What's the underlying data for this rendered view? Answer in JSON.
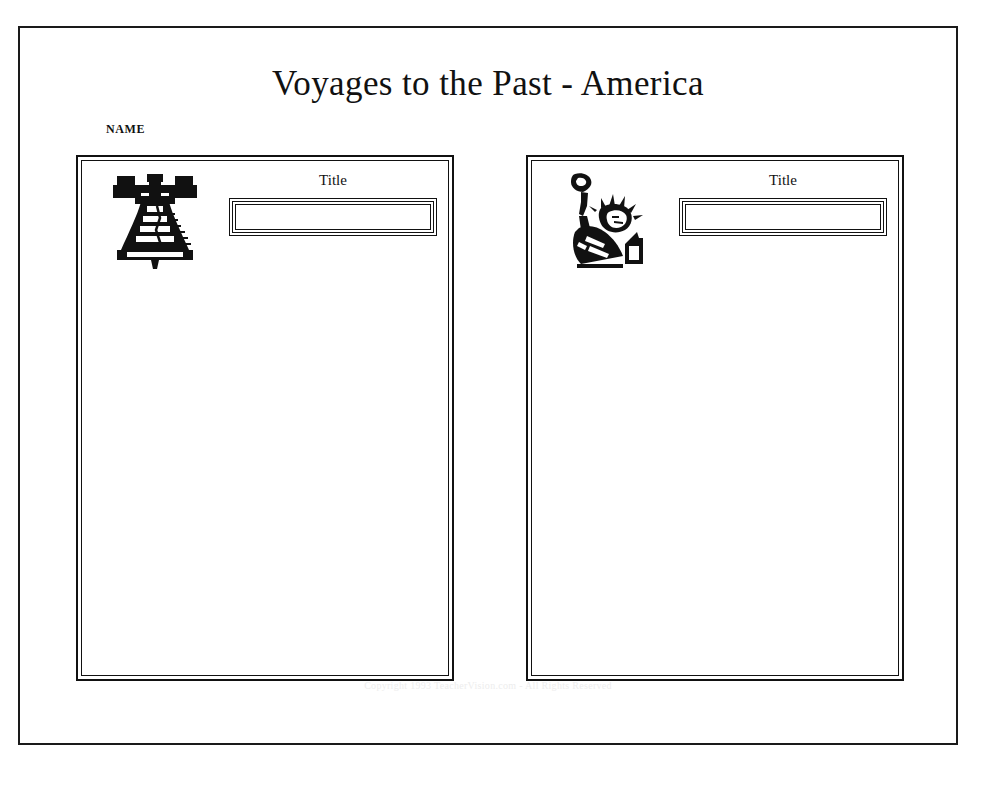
{
  "header": {
    "title": "Voyages to the Past - America",
    "name_label": "NAME"
  },
  "panels": [
    {
      "id": "left",
      "art_icon": "liberty-bell-icon",
      "title_caption": "Title",
      "title_value": "",
      "title_placeholder": ""
    },
    {
      "id": "right",
      "art_icon": "statue-of-liberty-icon",
      "title_caption": "Title",
      "title_value": "",
      "title_placeholder": ""
    }
  ],
  "footer": {
    "copyright": "Copyright 1993 TeacherVision.com - All Rights Reserved"
  },
  "colors": {
    "ink": "#111111",
    "page_background": "#ffffff",
    "footer_text": "#ededed"
  }
}
